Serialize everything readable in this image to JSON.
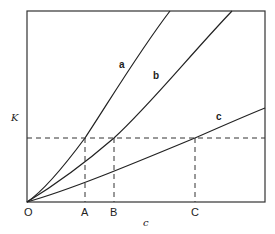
{
  "diagram": {
    "y_axis_label": "K",
    "x_axis_label": "c",
    "origin_label": "O",
    "x_markers": [
      {
        "label": "A",
        "x": 85
      },
      {
        "label": "B",
        "x": 114
      },
      {
        "label": "C",
        "x": 195
      }
    ],
    "curves": [
      {
        "label": "a"
      },
      {
        "label": "b"
      },
      {
        "label": "c"
      }
    ],
    "reference_line": "horizontal dashed line at constant K intersecting curves a, b, c at A, B, C"
  }
}
